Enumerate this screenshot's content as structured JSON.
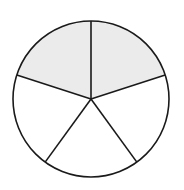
{
  "diagram": {
    "type": "fraction-circle",
    "total_parts": 5,
    "shaded_parts": 2,
    "fraction": "2/5",
    "colors": {
      "shaded": "#ebebeb",
      "unshaded": "#ffffff",
      "stroke": "#1a1a1a"
    }
  }
}
